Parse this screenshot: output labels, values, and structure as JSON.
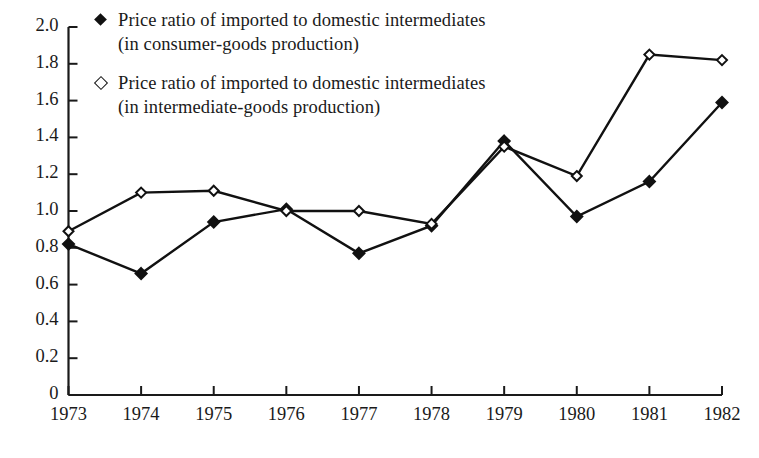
{
  "chart_data": {
    "type": "line",
    "title": "",
    "subtitle": "",
    "xlabel": "",
    "ylabel": "",
    "grid": false,
    "legend_position": "top-left-inside",
    "x": [
      "1973",
      "1974",
      "1975",
      "1976",
      "1977",
      "1978",
      "1979",
      "1980",
      "1981",
      "1982"
    ],
    "categories": [
      "1973",
      "1974",
      "1975",
      "1976",
      "1977",
      "1978",
      "1979",
      "1980",
      "1981",
      "1982"
    ],
    "xtick_labels": [
      "1973",
      "1974",
      "1975",
      "1976",
      "1977",
      "1978",
      "1979",
      "1980",
      "1981",
      "1982"
    ],
    "ytick_labels": [
      "2.0",
      "1.8",
      "1.6",
      "1.4",
      "1.2",
      "1.0",
      "0.8",
      "0.6",
      "0.4",
      "0.2",
      "0"
    ],
    "ytick_values": [
      2.0,
      1.8,
      1.6,
      1.4,
      1.2,
      1.0,
      0.8,
      0.6,
      0.4,
      0.2,
      0
    ],
    "ylim": [
      0,
      2.0
    ],
    "series": [
      {
        "name": "Price ratio of imported to domestic intermediates (in consumer-goods production)",
        "name_line1": "Price ratio of imported to domestic intermediates",
        "name_line2": "(in consumer-goods production)",
        "marker": "filled-diamond",
        "color": "#111111",
        "values": [
          0.82,
          0.66,
          0.94,
          1.01,
          0.77,
          0.92,
          1.38,
          0.97,
          1.16,
          1.59
        ]
      },
      {
        "name": "Price ratio of imported to domestic intermediates (in intermediate-goods production)",
        "name_line1": "Price ratio of imported to domestic intermediates",
        "name_line2": "(in intermediate-goods production)",
        "marker": "open-diamond",
        "color": "#111111",
        "values": [
          0.89,
          1.1,
          1.11,
          1.0,
          1.0,
          0.93,
          1.35,
          1.19,
          1.85,
          1.82
        ]
      }
    ]
  },
  "legend": {
    "entries": [
      {
        "marker": "filled-diamond",
        "line1": "Price ratio of imported to domestic intermediates",
        "line2": "(in consumer-goods production)"
      },
      {
        "marker": "open-diamond",
        "line1": "Price ratio of imported to domestic intermediates",
        "line2": "(in intermediate-goods production)"
      }
    ]
  }
}
